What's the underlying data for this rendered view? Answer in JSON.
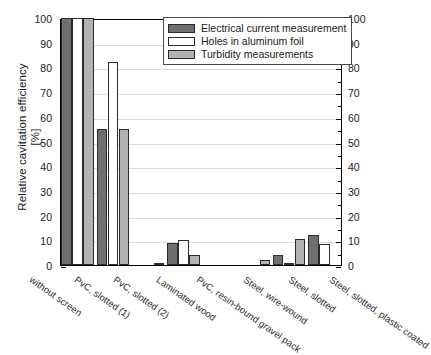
{
  "chart_data": {
    "type": "bar",
    "title": "",
    "xlabel": "",
    "ylabel": "Relative cavitation efficiency",
    "yunit": "[%]",
    "ylim": [
      0,
      100
    ],
    "ytick_step": 10,
    "yminor_step": 5,
    "grid": true,
    "dual_axis": true,
    "legend_position": "top-right",
    "categories": [
      "without screen",
      "PvC, slotted (1)",
      "PvC, slotted (2)",
      "Laminated wood",
      "PvC, resin-bound gravel pack",
      "Steel, wire-wound",
      "Steel, slotted",
      "Steel, slotted, plastic coated"
    ],
    "yticks": [
      "0",
      "10",
      "20",
      "30",
      "40",
      "50",
      "60",
      "70",
      "80",
      "90",
      "100"
    ],
    "series": [
      {
        "name": "Electrical current measurement",
        "color": "#6f6f6f",
        "values": [
          100,
          55,
          0,
          9,
          0,
          0,
          4,
          12
        ]
      },
      {
        "name": "Holes in aluminum foil",
        "color": "#ffffff",
        "values": [
          100,
          82,
          0,
          10,
          0,
          0,
          1,
          8.5
        ]
      },
      {
        "name": "Turbidity measurements",
        "color": "#b2b2b2",
        "values": [
          100,
          55,
          1,
          4,
          0,
          2,
          10.5,
          0
        ]
      }
    ]
  },
  "axis": {
    "left_title": "Relative cavitation efficiency",
    "left_unit": "[%]"
  }
}
